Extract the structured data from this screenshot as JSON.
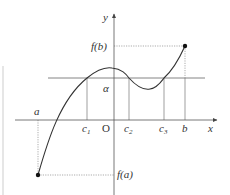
{
  "diagram": {
    "type": "function-graph",
    "axes": {
      "x_label": "x",
      "y_label": "y",
      "origin_label": "O"
    },
    "x_ticks": [
      {
        "id": "a",
        "label": "a"
      },
      {
        "id": "c1",
        "label": "c",
        "sub": "1"
      },
      {
        "id": "c2",
        "label": "c",
        "sub": "2"
      },
      {
        "id": "c3",
        "label": "c",
        "sub": "3"
      },
      {
        "id": "b",
        "label": "b"
      }
    ],
    "y_labels": {
      "fb": "f(b)",
      "alpha": "α",
      "fa": "f(a)"
    },
    "points": [
      {
        "name": "(a, f(a))",
        "filled": true
      },
      {
        "name": "(b, f(b))",
        "filled": true
      }
    ],
    "colors": {
      "curve": "#333333",
      "axis": "#555555",
      "guide": "#777777",
      "dotted": "#888888"
    }
  }
}
